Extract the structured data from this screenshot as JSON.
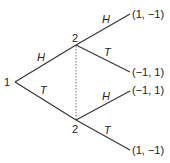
{
  "diagram": {
    "type": "extensive-form game tree",
    "root": {
      "player": "1"
    },
    "player2_nodes": [
      {
        "label": "2"
      },
      {
        "label": "2"
      }
    ],
    "information_set": "dotted line connecting both player 2 nodes",
    "actions": {
      "p1_upper": "H",
      "p1_lower": "T",
      "upper_to_top": "H",
      "upper_to_mid": "T",
      "lower_to_mid": "H",
      "lower_to_bottom": "T"
    },
    "payoffs": [
      "(1, −1)",
      "(−1, 1)",
      "(−1, 1)",
      "(1, −1)"
    ]
  }
}
